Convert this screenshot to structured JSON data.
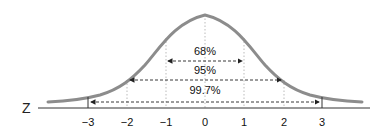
{
  "diagram": {
    "axis_label": "Z",
    "ticks": [
      "-3",
      "-2",
      "-1",
      "0",
      "1",
      "2",
      "3"
    ],
    "intervals": [
      {
        "label": "68%",
        "from": -1,
        "to": 1
      },
      {
        "label": "95%",
        "from": -2,
        "to": 2
      },
      {
        "label": "99.7%",
        "from": -3,
        "to": 3
      }
    ],
    "colors": {
      "curve": "#8c8c8c",
      "axis": "#333333",
      "arrows": "#222222",
      "guides": "#aaaaaa"
    }
  }
}
